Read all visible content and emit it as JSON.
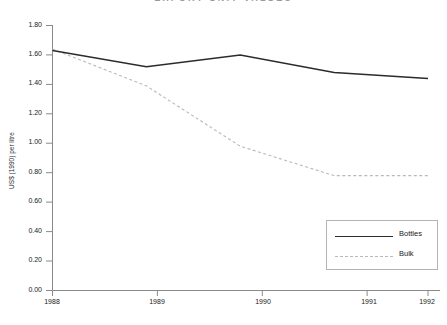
{
  "chart_data": {
    "type": "line",
    "title": "EXPORT UNIT VALUES",
    "title_note": "title is cropped at the top edge of the screenshot",
    "xlabel": "",
    "ylabel": "US$ (1990) per litre",
    "categories": [
      "1988",
      "1989",
      "1990",
      "1991",
      "1992"
    ],
    "x": [
      1988,
      1989,
      1990,
      1991,
      1992
    ],
    "xlim": [
      1988,
      1992
    ],
    "ylim": [
      0.0,
      1.8
    ],
    "ytick_labels": [
      "0.00",
      "0.20",
      "0.40",
      "0.60",
      "0.80",
      "1.00",
      "1.20",
      "1.40",
      "1.60",
      "1.80"
    ],
    "ytick_values": [
      0.0,
      0.2,
      0.4,
      0.6,
      0.8,
      1.0,
      1.2,
      1.4,
      1.6,
      1.8
    ],
    "grid": false,
    "legend_position": "bottom-right",
    "series": [
      {
        "name": "Bottles",
        "style": "solid",
        "color": "#2b2b2b",
        "values": [
          1.63,
          1.52,
          1.6,
          1.48,
          1.44
        ]
      },
      {
        "name": "Bulk",
        "style": "dashed",
        "color": "#b9b9b9",
        "values": [
          1.64,
          1.39,
          0.98,
          0.78,
          0.78
        ]
      }
    ]
  },
  "axes": {
    "y_title": "US$ (1990) per litre"
  },
  "legend": {
    "items": [
      {
        "label": "Bottles"
      },
      {
        "label": "Bulk"
      }
    ]
  }
}
